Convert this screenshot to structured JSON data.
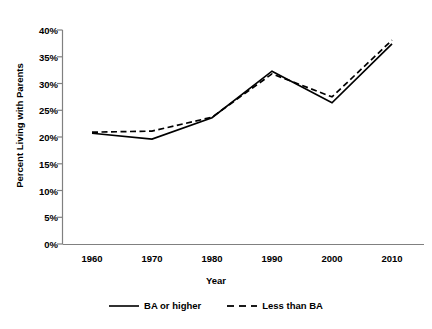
{
  "chart_data": {
    "type": "line",
    "title": "",
    "xlabel": "Year",
    "ylabel": "Percent Living with Parents",
    "categories": [
      "1960",
      "1970",
      "1980",
      "1990",
      "2000",
      "2010"
    ],
    "x": [
      1960,
      1970,
      1980,
      1990,
      2000,
      2010
    ],
    "xlim": [
      1955,
      2018
    ],
    "ylim": [
      0,
      40
    ],
    "yticks": [
      "0%",
      "5%",
      "10%",
      "15%",
      "20%",
      "25%",
      "30%",
      "35%",
      "40%"
    ],
    "ytick_values": [
      0,
      5,
      10,
      15,
      20,
      25,
      30,
      35,
      40
    ],
    "grid": false,
    "legend_position": "bottom-center",
    "series": [
      {
        "name": "BA or higher",
        "style": "solid",
        "color": "#000000",
        "values": [
          20.7,
          19.6,
          23.6,
          32.3,
          26.4,
          37.4
        ]
      },
      {
        "name": "Less than BA",
        "style": "dashed",
        "color": "#000000",
        "values": [
          20.9,
          21.1,
          23.7,
          31.8,
          27.5,
          38.1
        ]
      }
    ]
  },
  "legend": {
    "items": [
      {
        "label": "BA or higher"
      },
      {
        "label": "Less than BA"
      }
    ]
  },
  "axes": {
    "axis_color": "#808080"
  }
}
